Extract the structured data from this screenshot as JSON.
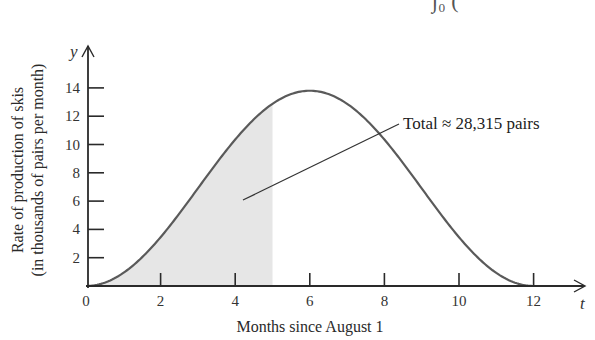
{
  "chart_data": {
    "type": "area",
    "title": "",
    "xlabel": "Months since August 1",
    "ylabel_line1": "Rate of production of skis",
    "ylabel_line2": "(in thousands of pairs per month)",
    "x_var": "t",
    "y_var": "y",
    "xlim": [
      0,
      13
    ],
    "ylim": [
      0,
      15
    ],
    "x_ticks": [
      0,
      2,
      4,
      6,
      8,
      10,
      12
    ],
    "y_ticks": [
      2,
      4,
      6,
      8,
      10,
      12,
      14
    ],
    "x_tick_labels": [
      "0",
      "2",
      "4",
      "6",
      "8",
      "10",
      "12"
    ],
    "y_tick_labels": [
      "2",
      "4",
      "6",
      "8",
      "10",
      "12",
      "14"
    ],
    "grid": false,
    "series": [
      {
        "name": "production rate",
        "x": [
          0,
          1,
          2,
          3,
          4,
          5,
          6,
          7,
          8,
          9,
          10,
          11,
          12
        ],
        "values": [
          0,
          1.0,
          3.6,
          7.0,
          10.5,
          12.9,
          13.8,
          12.9,
          10.5,
          7.0,
          3.6,
          1.0,
          0
        ]
      }
    ],
    "shaded_region": {
      "from": 0,
      "to": 5,
      "color": "#e6e6e6"
    },
    "annotations": [
      {
        "text": "Total ≈ 28,315 pairs",
        "points_to": [
          4.3,
          6.2
        ]
      }
    ]
  },
  "colors": {
    "curve": "#5a5a5a",
    "axis": "#2a2a2a",
    "shade": "#e6e6e6"
  },
  "partial_top_text": "∫₀ ("
}
